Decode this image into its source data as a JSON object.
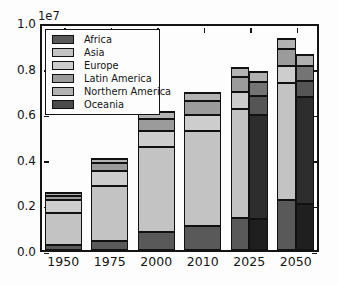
{
  "figure": {
    "axes": {
      "offset_label": "1e7",
      "ytick_labels": [
        "0.0",
        "0.2",
        "0.4",
        "0.6",
        "0.8",
        "1.0"
      ],
      "ytick_values": [
        0,
        2000000,
        4000000,
        6000000,
        8000000,
        10000000
      ],
      "xtick_labels": [
        "1950",
        "1975",
        "2000",
        "2010",
        "2025",
        "2050"
      ]
    },
    "legend": {
      "items": [
        {
          "label": "Africa",
          "color": "#595959"
        },
        {
          "label": "Asia",
          "color": "#c3c3c3"
        },
        {
          "label": "Europe",
          "color": "#cdcdcd"
        },
        {
          "label": "Latin America",
          "color": "#9b9b9b"
        },
        {
          "label": "Northern America",
          "color": "#b3b3b3"
        },
        {
          "label": "Oceania",
          "color": "#4b4b4b"
        }
      ]
    }
  },
  "chart_data": {
    "type": "bar",
    "stacked": true,
    "title": "",
    "xlabel": "",
    "ylabel": "",
    "axis_offset_label": "1e7",
    "ylim": [
      0,
      10000000
    ],
    "yticks": [
      0,
      2000000,
      4000000,
      6000000,
      8000000,
      10000000
    ],
    "grid": false,
    "legend_position": "upper left",
    "categories": [
      "1950",
      "1975",
      "2000",
      "2010",
      "2025",
      "2050"
    ],
    "series": [
      {
        "name": "Africa",
        "color": "#595959",
        "values": [
          230000,
          416000,
          811000,
          1031000,
          1400000,
          2192000
        ]
      },
      {
        "name": "Asia",
        "color": "#c3c3c3",
        "values": [
          1403000,
          2379000,
          3698000,
          4167000,
          4773000,
          5142000
        ]
      },
      {
        "name": "Europe",
        "color": "#cdcdcd",
        "values": [
          547000,
          676000,
          726000,
          738000,
          744000,
          719000
        ]
      },
      {
        "name": "Latin America",
        "color": "#9b9b9b",
        "values": [
          167000,
          323000,
          521000,
          590000,
          669000,
          751000
        ]
      },
      {
        "name": "Northern America",
        "color": "#b3b3b3",
        "values": [
          172000,
          242000,
          313000,
          345000,
          388000,
          447000
        ]
      },
      {
        "name": "Oceania",
        "color": "#4b4b4b",
        "values": [
          13000,
          21000,
          31000,
          37000,
          42000,
          55000
        ]
      }
    ],
    "secondary_dark_bars": {
      "categories": [
        "2025",
        "2050"
      ],
      "series": [
        {
          "name": "Africa",
          "color": "#1f1f1f",
          "values": [
            1380000,
            2000000
          ]
        },
        {
          "name": "Asia",
          "color": "#2d2d2d",
          "values": [
            4560000,
            4730000
          ]
        },
        {
          "name": "Europe",
          "color": "#555555",
          "values": [
            820000,
            680000
          ]
        },
        {
          "name": "Latin America",
          "color": "#747474",
          "values": [
            600000,
            650000
          ]
        },
        {
          "name": "Northern America",
          "color": "#b0b0b0",
          "values": [
            460000,
            500000
          ]
        },
        {
          "name": "Oceania",
          "color": "#333333",
          "values": [
            40000,
            50000
          ]
        }
      ]
    }
  }
}
